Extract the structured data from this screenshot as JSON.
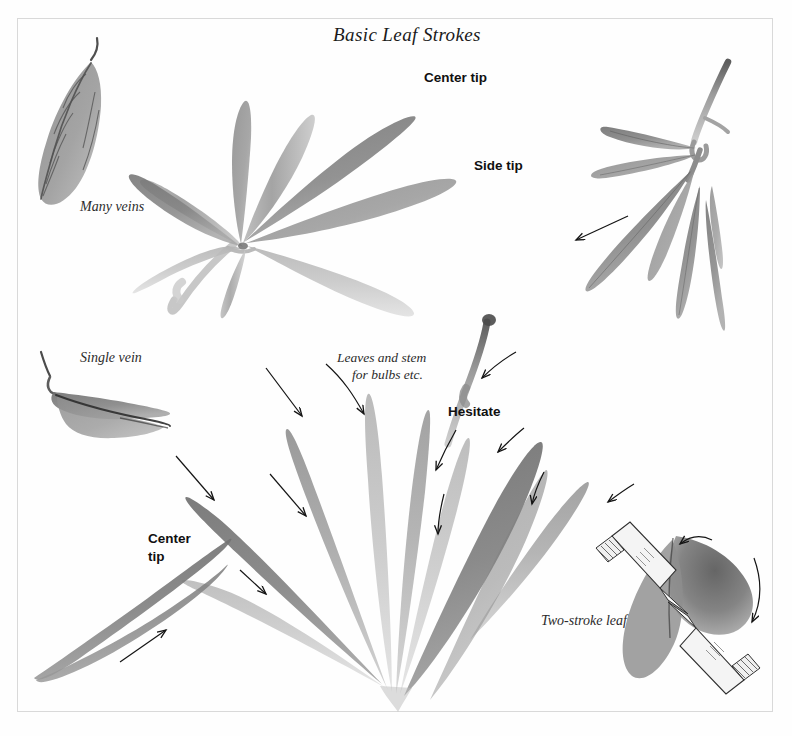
{
  "page": {
    "title": "Basic Leaf Strokes",
    "background_color": "#ffffff",
    "frame_color": "#d9d9d9",
    "ink_color": "#6e6e6e",
    "ink_dark_color": "#4a4a4a",
    "arrow_color": "#141414"
  },
  "labels": {
    "many_veins": "Many veins",
    "single_vein": "Single vein",
    "center_tip_top": "Center tip",
    "side_tip": "Side tip",
    "leaves_and_stem_line1": "Leaves and stem",
    "leaves_and_stem_line2": "for bulbs etc.",
    "hesitate": "Hesitate",
    "center_tip_left_line1": "Center",
    "center_tip_left_line2": "tip",
    "two_stroke_leaf": "Two-stroke leaf"
  },
  "figures": [
    {
      "name": "many-veins-leaf",
      "caption": "Many veins",
      "description": "Single elongated pointed leaf with stem, central vein and six side veins"
    },
    {
      "name": "bamboo-spray",
      "caption": "Center tip / Side tip",
      "description": "Spray of six tapered bamboo leaves radiating from a stem node with trailing stem"
    },
    {
      "name": "drooping-leaf-cluster",
      "caption": "",
      "description": "Curving stem with six drooping narrow leaves and one direction arrow"
    },
    {
      "name": "single-vein-leaf",
      "caption": "Single vein",
      "description": "Curved boat shaped leaf with one dark center vein and stem"
    },
    {
      "name": "bulb-leaf-fan",
      "caption": "Leaves and stem for bulbs etc. / Hesitate",
      "description": "Fan of eight long blade leaves rising from one base point with a wavy bulb stem and eight direction arrows"
    },
    {
      "name": "center-tip-leaf",
      "caption": "Center tip",
      "description": "Long double pointed leaf angled up to the right with a direction arrow"
    },
    {
      "name": "two-stroke-leaf",
      "caption": "Two-stroke leaf",
      "description": "Dark leaf formed by two brush strokes shown with two white brushes and two curved arrows"
    }
  ],
  "arrows": [
    {
      "name": "arrow-drooping-cluster",
      "direction": "down-left"
    },
    {
      "name": "arrow-fan-upper-left",
      "direction": "down-right"
    },
    {
      "name": "arrow-fan-left-curved",
      "direction": "down-right"
    },
    {
      "name": "arrow-fan-far-left",
      "direction": "down-right"
    },
    {
      "name": "arrow-fan-lower-left",
      "direction": "down-right"
    },
    {
      "name": "arrow-fan-bottom-left",
      "direction": "down-right"
    },
    {
      "name": "arrow-bulb-stem-top",
      "direction": "down-left"
    },
    {
      "name": "arrow-hesitate-upper",
      "direction": "down-left"
    },
    {
      "name": "arrow-hesitate-lower",
      "direction": "down"
    },
    {
      "name": "arrow-fan-right-upper",
      "direction": "down-left"
    },
    {
      "name": "arrow-fan-right-lower",
      "direction": "down-left"
    },
    {
      "name": "arrow-center-tip-leaf",
      "direction": "up-right"
    },
    {
      "name": "arrow-two-stroke-first",
      "direction": "left"
    },
    {
      "name": "arrow-two-stroke-second",
      "direction": "down"
    }
  ]
}
